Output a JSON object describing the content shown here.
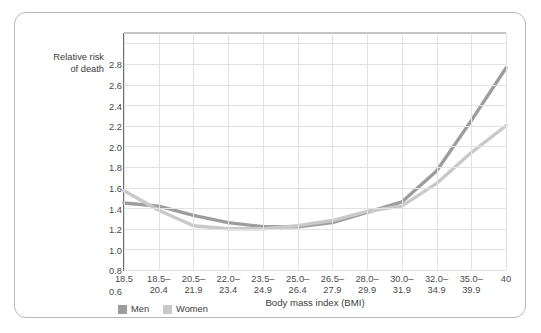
{
  "chart_data": {
    "type": "line",
    "title": "",
    "xlabel": "Body mass index (BMI)",
    "ylabel": "Relative risk\nof death",
    "ylim": [
      0.6,
      2.9
    ],
    "yticks": [
      0.6,
      0.8,
      1.0,
      1.2,
      1.4,
      1.6,
      1.8,
      2.0,
      2.2,
      2.4,
      2.6,
      2.8
    ],
    "ytick_labels": [
      "0.6",
      "0.8",
      "1.0",
      "1.2",
      "1.4",
      "1.6",
      "1.8",
      "2.0",
      "2.2",
      "2.4",
      "2.6",
      "2.8"
    ],
    "grid": true,
    "legend_position": "bottom-left",
    "categories": [
      "18.5",
      "18.5–\n20.4",
      "20.5–\n21.9",
      "22.0–\n23.4",
      "23.5–\n24.9",
      "25.0–\n26.4",
      "26.5–\n27.9",
      "28.0–\n29.9",
      "30.0–\n31.9",
      "32.0–\n34.9",
      "35.0–\n39.9",
      "40"
    ],
    "series": [
      {
        "name": "Men",
        "color": "#9d9d9d",
        "values": [
          1.25,
          1.22,
          1.13,
          1.06,
          1.02,
          1.02,
          1.06,
          1.16,
          1.26,
          1.56,
          2.05,
          2.56
        ]
      },
      {
        "name": "Women",
        "color": "#c9c9c9",
        "values": [
          1.37,
          1.18,
          1.03,
          1.0,
          1.0,
          1.03,
          1.08,
          1.17,
          1.22,
          1.44,
          1.74,
          2.0
        ]
      }
    ]
  },
  "legend": {
    "items": [
      {
        "label": "Men",
        "color": "#9d9d9d"
      },
      {
        "label": "Women",
        "color": "#c9c9c9"
      }
    ]
  },
  "axis": {
    "y_title": "Relative risk\nof death",
    "x_title": "Body mass index (BMI)"
  }
}
